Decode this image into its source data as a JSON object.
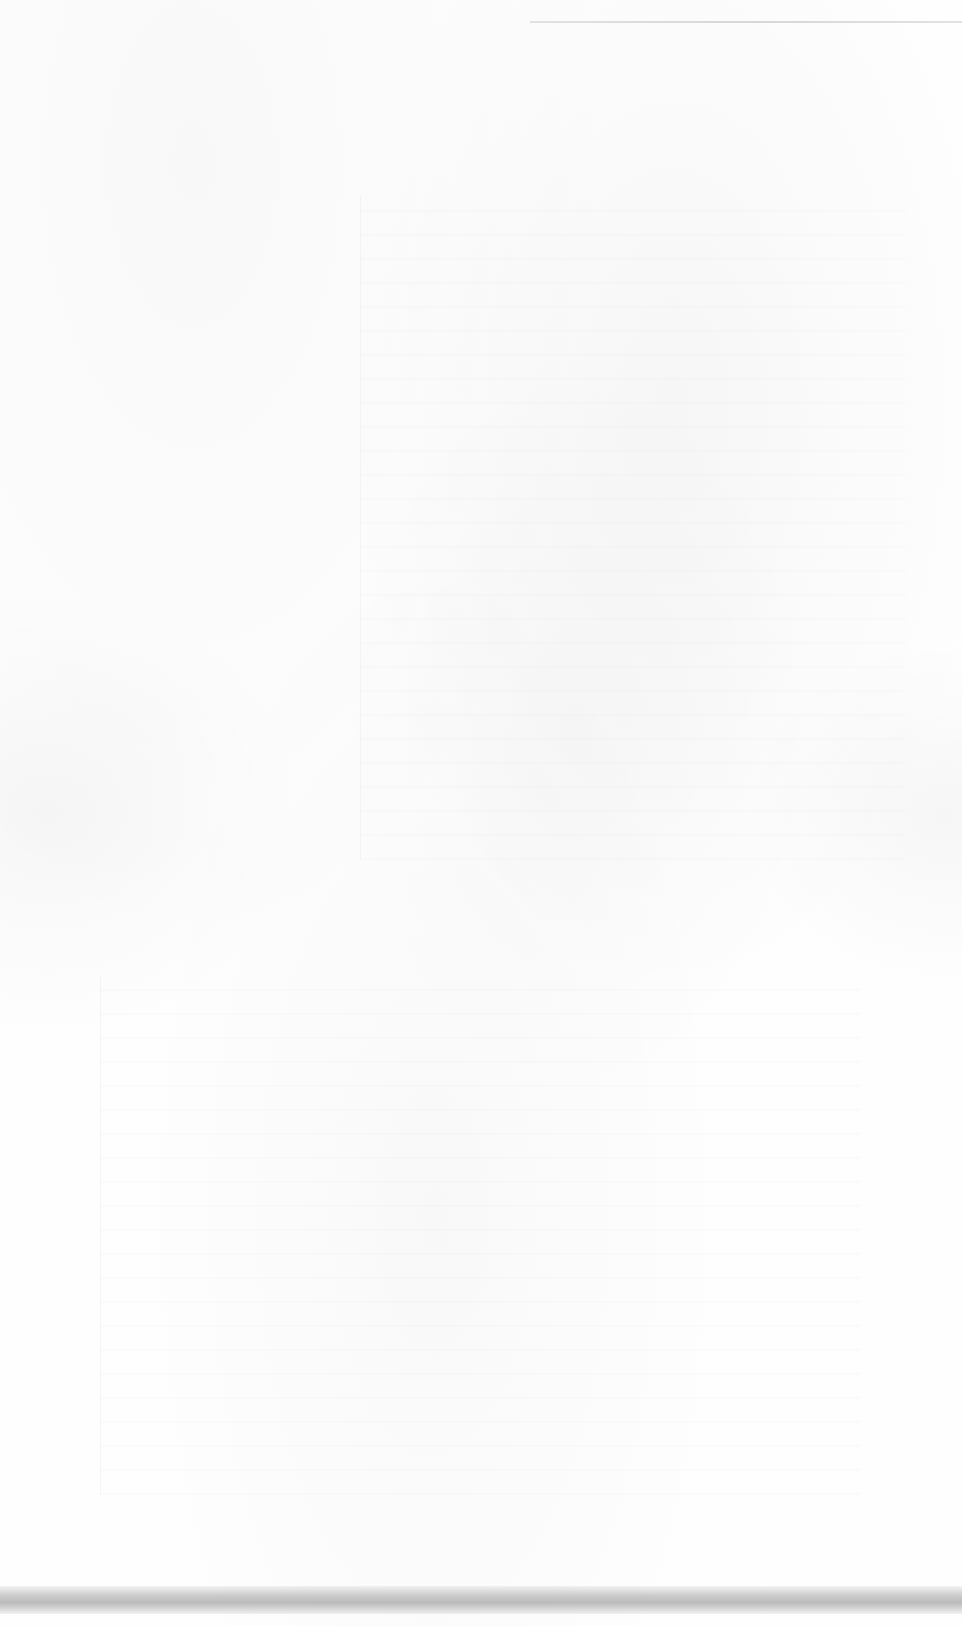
{
  "document": {
    "type": "scanned-page",
    "content_state": "blank",
    "text": ""
  },
  "colors": {
    "paper": "#fefefe",
    "scan_band": "#a8a8a8",
    "top_rule": "#aaaaaa"
  }
}
